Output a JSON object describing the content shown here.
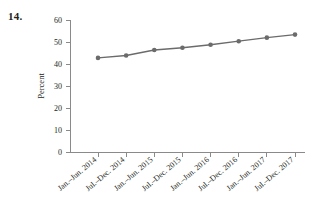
{
  "figure": {
    "number_label": "14."
  },
  "chart_data": {
    "type": "line",
    "title": "",
    "subtitle": "",
    "xlabel": "",
    "ylabel": "Percent",
    "categories": [
      "Jan.–Jun. 2014",
      "Jul.–Dec. 2014",
      "Jan.–Jun. 2015",
      "Jul.–Dec. 2015",
      "Jan.–Jun. 2016",
      "Jul.–Dec. 2016",
      "Jan.–Jun. 2017",
      "Jul.–Dec. 2017"
    ],
    "values": [
      43.0,
      44.1,
      46.6,
      47.6,
      49.0,
      50.6,
      52.2,
      53.6
    ],
    "series": [
      {
        "name": "Percent",
        "values": [
          43.0,
          44.1,
          46.6,
          47.6,
          49.0,
          50.6,
          52.2,
          53.6
        ]
      }
    ],
    "ylim": [
      0,
      60
    ],
    "yticks": [
      0,
      10,
      20,
      30,
      40,
      50,
      60
    ],
    "ytick_labels": [
      "0",
      "10",
      "20",
      "30",
      "40",
      "50",
      "60"
    ],
    "grid": false,
    "legend": false,
    "legend_position": "none",
    "marker": "circle",
    "colors": {
      "series": "#6b6b6b",
      "axis": "#8a8a8a",
      "text": "#231f20",
      "background": "#ffffff"
    }
  }
}
